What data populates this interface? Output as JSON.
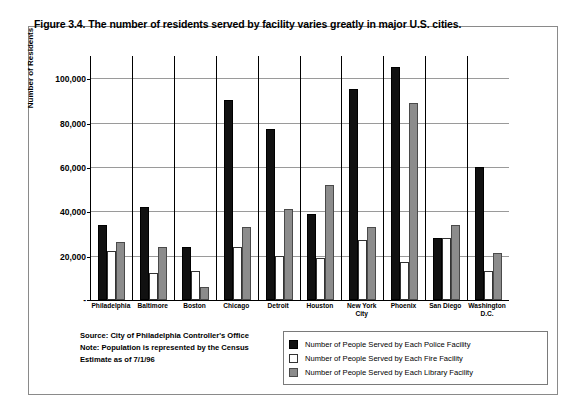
{
  "figure": {
    "title": "Figure 3.4. The number of residents served by facility varies greatly in major U.S. cities."
  },
  "notes": {
    "line1": "Source: City of Philadelphia Controller's Office",
    "line2": "Note: Population is represented by the Census",
    "line3": "Estimate as of 7/1/96"
  },
  "legend": {
    "items": [
      {
        "label": "Number of People Served by Each Police Facility",
        "swatch": "police",
        "color": "#111111"
      },
      {
        "label": "Number of People Served by Each Fire Facility",
        "swatch": "fire",
        "color": "#ffffff"
      },
      {
        "label": "Number of People Served by Each Library Facility",
        "swatch": "library",
        "color": "#8c8c8c"
      }
    ]
  },
  "chart_data": {
    "type": "bar",
    "title": "Figure 3.4. The number of residents served by facility varies greatly in major U.S. cities.",
    "xlabel": "",
    "ylabel": "Number of Residents",
    "ylim": [
      0,
      110000
    ],
    "yticks": [
      0,
      20000,
      40000,
      60000,
      80000,
      100000
    ],
    "ytick_labels": [
      "-",
      "20,000",
      "40,000",
      "60,000",
      "80,000",
      "100,000"
    ],
    "grid": true,
    "legend_position": "bottom-right",
    "categories": [
      "Philadelphia",
      "Baltimore",
      "Boston",
      "Chicago",
      "Detroit",
      "Houston",
      "New York\nCity",
      "Phoenix",
      "San Diego",
      "Washington D.C."
    ],
    "series": [
      {
        "name": "Number of People Served by Each Police Facility",
        "key": "police",
        "color": "#111111",
        "values": [
          34000,
          42000,
          24000,
          90000,
          77000,
          39000,
          95000,
          105000,
          28000,
          60000
        ]
      },
      {
        "name": "Number of People Served by Each Fire Facility",
        "key": "fire",
        "color": "#ffffff",
        "values": [
          22000,
          12000,
          13000,
          24000,
          20000,
          19000,
          27000,
          17000,
          28000,
          13000
        ]
      },
      {
        "name": "Number of People Served by Each Library Facility",
        "key": "library",
        "color": "#8c8c8c",
        "values": [
          26000,
          24000,
          6000,
          33000,
          41000,
          52000,
          33000,
          89000,
          34000,
          21000
        ]
      }
    ]
  }
}
